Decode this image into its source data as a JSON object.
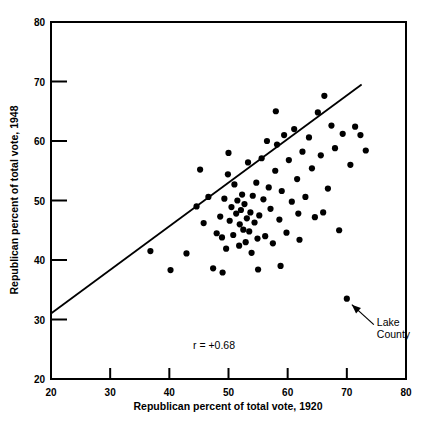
{
  "chart_data": {
    "type": "scatter",
    "title": "",
    "xlabel": "Republican percent of total vote, 1920",
    "ylabel": "Republican percent of total vote, 1948",
    "xlim": [
      20,
      80
    ],
    "ylim": [
      20,
      80
    ],
    "xticks": [
      20,
      30,
      40,
      50,
      60,
      70,
      80
    ],
    "yticks": [
      20,
      30,
      40,
      50,
      60,
      70,
      80
    ],
    "xtick_labels": [
      "20",
      "30",
      "40",
      "50",
      "60",
      "70",
      "80"
    ],
    "ytick_labels": [
      "20",
      "30",
      "40",
      "50",
      "60",
      "70",
      "80"
    ],
    "grid": false,
    "legend": false,
    "correlation_label": "r = +0.68",
    "annotation": {
      "label_line1": "Lake",
      "label_line2": "County",
      "point": [
        70.0,
        33.5
      ]
    },
    "trendline": {
      "x": [
        20.0,
        72.5
      ],
      "y": [
        31.0,
        69.5
      ]
    },
    "points": [
      [
        36.8,
        41.5
      ],
      [
        40.2,
        38.3
      ],
      [
        42.9,
        41.1
      ],
      [
        44.6,
        49.0
      ],
      [
        45.2,
        55.2
      ],
      [
        46.6,
        50.6
      ],
      [
        47.4,
        38.6
      ],
      [
        48.0,
        44.5
      ],
      [
        48.6,
        47.3
      ],
      [
        48.9,
        43.8
      ],
      [
        49.3,
        50.3
      ],
      [
        49.6,
        41.9
      ],
      [
        49.9,
        54.4
      ],
      [
        50.2,
        46.6
      ],
      [
        50.5,
        48.9
      ],
      [
        50.8,
        44.2
      ],
      [
        51.0,
        52.7
      ],
      [
        51.3,
        47.8
      ],
      [
        51.5,
        50.0
      ],
      [
        51.8,
        42.4
      ],
      [
        51.9,
        46.0
      ],
      [
        52.1,
        48.4
      ],
      [
        52.3,
        51.0
      ],
      [
        52.5,
        45.1
      ],
      [
        52.7,
        49.4
      ],
      [
        52.9,
        43.0
      ],
      [
        53.1,
        47.0
      ],
      [
        53.3,
        56.4
      ],
      [
        53.5,
        44.8
      ],
      [
        53.7,
        48.0
      ],
      [
        53.9,
        41.2
      ],
      [
        54.1,
        50.8
      ],
      [
        54.4,
        46.3
      ],
      [
        54.7,
        53.0
      ],
      [
        54.9,
        43.6
      ],
      [
        55.2,
        47.5
      ],
      [
        55.6,
        57.1
      ],
      [
        55.9,
        50.2
      ],
      [
        56.2,
        44.0
      ],
      [
        56.5,
        60.0
      ],
      [
        56.8,
        52.2
      ],
      [
        57.1,
        48.6
      ],
      [
        57.5,
        42.8
      ],
      [
        57.9,
        55.0
      ],
      [
        58.2,
        59.4
      ],
      [
        58.6,
        46.8
      ],
      [
        59.0,
        51.6
      ],
      [
        59.4,
        61.0
      ],
      [
        59.8,
        44.6
      ],
      [
        60.2,
        56.8
      ],
      [
        60.7,
        49.8
      ],
      [
        61.1,
        62.0
      ],
      [
        61.6,
        53.6
      ],
      [
        62.0,
        43.4
      ],
      [
        62.5,
        58.2
      ],
      [
        63.0,
        50.6
      ],
      [
        63.6,
        60.6
      ],
      [
        64.1,
        55.4
      ],
      [
        64.6,
        47.2
      ],
      [
        65.1,
        64.8
      ],
      [
        65.6,
        57.6
      ],
      [
        66.2,
        67.6
      ],
      [
        66.8,
        52.0
      ],
      [
        67.4,
        62.6
      ],
      [
        68.0,
        58.8
      ],
      [
        68.7,
        45.0
      ],
      [
        69.3,
        61.2
      ],
      [
        70.0,
        33.5
      ],
      [
        70.6,
        56.0
      ],
      [
        71.4,
        62.4
      ],
      [
        72.3,
        61.0
      ],
      [
        73.2,
        58.4
      ],
      [
        58.0,
        65.0
      ],
      [
        50.0,
        58.0
      ],
      [
        45.8,
        46.2
      ],
      [
        55.0,
        38.4
      ],
      [
        58.8,
        39.0
      ],
      [
        61.8,
        47.8
      ],
      [
        66.0,
        48.0
      ],
      [
        49.0,
        37.9
      ]
    ]
  }
}
